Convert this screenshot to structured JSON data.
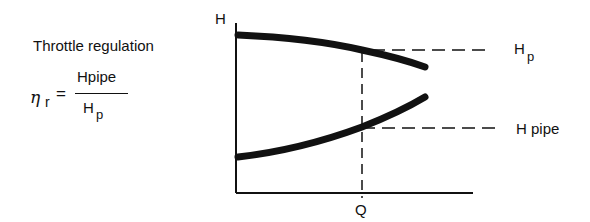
{
  "left_panel": {
    "title": "Throttle regulation",
    "formula": {
      "lhs_symbol": "η",
      "lhs_subscript": "r",
      "equals": "=",
      "numerator": "Hpipe",
      "denominator_main": "H",
      "denominator_subscript": "p"
    }
  },
  "diagram": {
    "y_axis_label": "H",
    "x_axis_label": "Q",
    "curves": [
      {
        "name": "pump-curve",
        "description": "Pump head curve, falling with Q"
      },
      {
        "name": "pipe-curve",
        "description": "System/pipe curve, rising with Q"
      }
    ],
    "reference_lines": [
      {
        "name": "Hp-line",
        "label_main": "H",
        "label_subscript": "p"
      },
      {
        "name": "Hpipe-line",
        "label": "H pipe"
      },
      {
        "name": "Q-line",
        "label": "Q"
      }
    ],
    "colors": {
      "line": "#111111",
      "background": "#ffffff"
    }
  }
}
